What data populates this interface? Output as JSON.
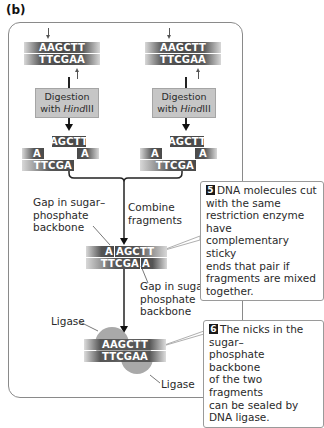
{
  "panel_label": "(b)",
  "colors": {
    "strand": "#4a4a4a",
    "strand_text": "#ffffff",
    "digest_box": "#c6c6c6",
    "ligase": "#9a9a9a",
    "badge": "#1a1a1a",
    "frame_border": "#8a8a8a"
  },
  "left_molecule": {
    "top_strand": "AAGCTT",
    "bottom_strand": "TTCGAA"
  },
  "right_molecule": {
    "top_strand": "AAGCTT",
    "bottom_strand": "TTCGAA"
  },
  "digestion": {
    "line1": "Digestion",
    "line2_prefix": "with ",
    "enzyme_italic": "Hind",
    "enzyme_suffix": "III"
  },
  "left_fragments": {
    "top_overhang": "AGCTT",
    "left_piece": "A",
    "right_piece": "A",
    "bottom": "TTCGA"
  },
  "right_fragments": {
    "top_overhang": "AGCTT",
    "left_piece": "A",
    "right_piece": "A",
    "bottom": "TTCGA"
  },
  "combine_label": [
    "Combine",
    "fragments"
  ],
  "gap_label_top": [
    "Gap in sugar–",
    "phosphate",
    "backbone"
  ],
  "combined": {
    "top_left": "A",
    "top_right": "AGCTT",
    "bottom_left": "TTCGA",
    "bottom_right": "A"
  },
  "gap_label_bottom": [
    "Gap in sugar–",
    "phosphate",
    "backbone"
  ],
  "ligase_labels": [
    "Ligase",
    "Ligase"
  ],
  "sealed": {
    "top_strand": "AAGCTT",
    "bottom_strand": "TTCGAA"
  },
  "steps": [
    {
      "number": "5",
      "lines": [
        "DNA molecules cut",
        "with the same",
        "restriction enzyme have",
        "complementary sticky",
        "ends that pair if",
        "fragments are mixed",
        "together."
      ]
    },
    {
      "number": "6",
      "lines": [
        "The nicks in the sugar–",
        "phosphate backbone",
        "of the two fragments",
        "can be sealed by",
        "DNA ligase."
      ]
    }
  ]
}
